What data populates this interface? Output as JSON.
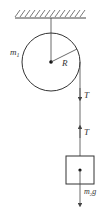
{
  "diagram": {
    "labels": {
      "pulley_mass": "m",
      "pulley_mass_sub": "1",
      "radius": "R",
      "tension_top": "T",
      "tension_bottom": "T",
      "weight": "m",
      "weight_sub": "2",
      "weight_g": "g"
    },
    "colors": {
      "stroke": "#444444",
      "text": "#333333",
      "background": "#ffffff"
    }
  }
}
